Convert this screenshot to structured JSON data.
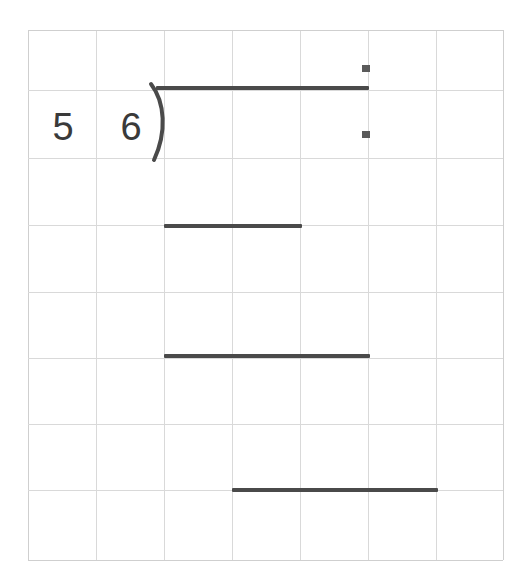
{
  "worksheet": {
    "title": "Long division on grid paper",
    "problem": {
      "divisor": "5",
      "dividend": "6",
      "bracket_glyph": ")",
      "notation": "5 6)"
    },
    "colors": {
      "grid_line": "#d9d9d9",
      "grid_edge": "#cfcfcf",
      "ink": "#4a4a4a",
      "digit_ink": "#3a3a3a",
      "mark": "#5a5a5a",
      "paper": "#ffffff"
    },
    "grid": {
      "columns": 7,
      "rows": 8,
      "cell_width_px": 68,
      "cell_height_px": 66,
      "x_positions": [
        28,
        96,
        164,
        232,
        300,
        368,
        436,
        503
      ],
      "y_positions": [
        30,
        90,
        158,
        225,
        292,
        358,
        424,
        490,
        560
      ]
    },
    "digits": [
      {
        "name": "divisor",
        "value": "5",
        "x": 38,
        "y": 108
      },
      {
        "name": "dividend",
        "value": "6",
        "x": 106,
        "y": 108
      }
    ],
    "work_lines": [
      {
        "name": "vinculum",
        "label": "division bar",
        "x": 156,
        "y": 86,
        "width": 213
      },
      {
        "name": "subtraction-bar-1",
        "label": "first subtraction bar",
        "x": 164,
        "y": 224,
        "width": 138
      },
      {
        "name": "subtraction-bar-2",
        "label": "second subtraction bar",
        "x": 164,
        "y": 354,
        "width": 206
      },
      {
        "name": "subtraction-bar-3",
        "label": "third subtraction bar",
        "x": 232,
        "y": 488,
        "width": 206
      }
    ],
    "square_marks": [
      {
        "name": "upper-square-mark",
        "x": 362,
        "y": 65
      },
      {
        "name": "lower-square-mark",
        "x": 362,
        "y": 131
      }
    ],
    "chart_data": {
      "type": "table",
      "title": "Long division on grid paper",
      "xlabel": "grid columns",
      "ylabel": "grid rows",
      "categories": [
        "col1",
        "col2",
        "col3",
        "col4",
        "col5",
        "col6",
        "col7"
      ],
      "values": [
        0,
        0,
        0,
        0,
        0,
        0,
        0
      ],
      "annotations": [
        "divisor 5 in column 1, row 2",
        "dividend 6 in column 2, row 2",
        "division bracket at column 3 left edge, row 2",
        "vinculum spans columns 3 through 5, top of row 2",
        "two square marks stacked on the column 6 grid line in row 1 and row 2",
        "first subtraction bar spans columns 3 through 4 at row 3/4 boundary",
        "second subtraction bar spans columns 3 through 5 at row 5/6 boundary",
        "third subtraction bar spans columns 4 through 6 at row 7/8 boundary"
      ]
    }
  }
}
